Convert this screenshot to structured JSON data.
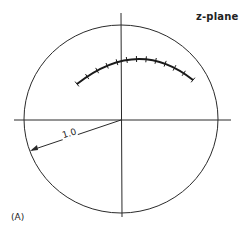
{
  "figure": {
    "plane_label": "z-plane",
    "panel_label": "(A)",
    "radius_label": "1.0"
  },
  "geometry": {
    "unit_circle": {
      "cx": 121,
      "cy": 119,
      "rx": 97,
      "ry": 94
    },
    "real_axis": {
      "x1": 14,
      "y1": 120,
      "x2": 231,
      "y2": 120
    },
    "imag_axis": {
      "x1": 121,
      "y1": 13,
      "x2": 122,
      "y2": 217
    },
    "radius_arrow": {
      "x1": 121,
      "y1": 120,
      "x2": 30,
      "y2": 151
    },
    "root_locus_arc": {
      "start": [
        77,
        84
      ],
      "control": [
        138,
        36
      ],
      "end": [
        193,
        80
      ],
      "tick_count": 13
    }
  },
  "colors": {
    "line": "#2a2a2a",
    "background": "#ffffff"
  }
}
